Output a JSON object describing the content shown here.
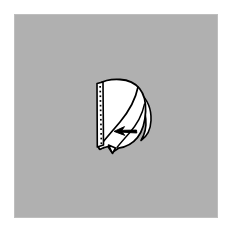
{
  "figure": {
    "caption": "",
    "panel": {
      "background_color": "#b0b0b0",
      "page_background_color": "#ffffff",
      "x": 14,
      "y": 14,
      "width": 204,
      "height": 204
    },
    "drawing": {
      "title": "Folded paper form with perforated edge and fold-back flap",
      "line_color": "#000000",
      "fill_color": "#ffffff",
      "shaded_fill_color": "#ffffff",
      "parts": [
        {
          "name": "main-body",
          "label": "Main folded body",
          "description": "Rounded quadrilateral sheet, flat on the left, bulging to the right"
        },
        {
          "name": "perforated-strip",
          "label": "Perforated edge strip",
          "description": "Narrow vertical band along the left edge marked with a column of dots",
          "dot_count": 13,
          "dot_color": "#000000"
        },
        {
          "name": "diagonal-fold-line",
          "label": "Diagonal fold line",
          "description": "Curved crease running from upper right to lower left"
        },
        {
          "name": "right-flap",
          "label": "Fold-back flap",
          "description": "Crescent shaped flap curling around the right side"
        },
        {
          "name": "bottom-point",
          "label": "Bottom point",
          "description": "Small pointed tab at the lower left of the body"
        },
        {
          "name": "direction-arrow",
          "label": "Fold direction arrow",
          "direction": "left",
          "description": "Solid black arrow pointing left, indicating the fold direction"
        }
      ]
    }
  }
}
